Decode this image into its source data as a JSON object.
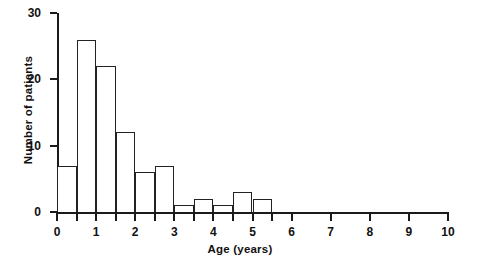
{
  "chart_data": {
    "type": "bar",
    "title": "",
    "subtitle": "",
    "xlabel": "Age (years)",
    "ylabel": "Number of patients",
    "grid": false,
    "legend": null,
    "bin_width": 0.5,
    "xlim": [
      0,
      10
    ],
    "ylim": [
      0,
      30
    ],
    "xticks": [
      0,
      1,
      2,
      3,
      4,
      5,
      6,
      7,
      8,
      9,
      10
    ],
    "xticklabels": [
      "0",
      "1",
      "2",
      "3",
      "4",
      "5",
      "6",
      "7",
      "8",
      "9",
      "10"
    ],
    "xminorticks": [
      0.5,
      1.5,
      2.5,
      3.5,
      4.5,
      5.5
    ],
    "yticks": [
      0,
      10,
      20,
      30
    ],
    "yticklabels": [
      "0",
      "10",
      "20",
      "30"
    ],
    "categories": [
      "0-0.5",
      "0.5-1",
      "1-1.5",
      "1.5-2",
      "2-2.5",
      "2.5-3",
      "3-3.5",
      "3.5-4",
      "4-4.5",
      "4.5-5",
      "5-5.5",
      "5.5-6"
    ],
    "bin_edges": [
      0,
      0.5,
      1,
      1.5,
      2,
      2.5,
      3,
      3.5,
      4,
      4.5,
      5,
      5.5,
      6
    ],
    "values": [
      7,
      26,
      22,
      12,
      6,
      7,
      1,
      2,
      1,
      3,
      2,
      0
    ],
    "bar_edge_color": "#222222",
    "bar_fill_color": "#ffffff",
    "axis_color": "#1a1a1a"
  }
}
